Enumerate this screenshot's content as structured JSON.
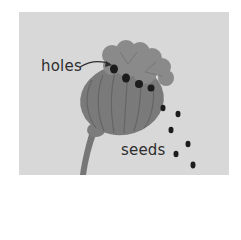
{
  "illustration": {
    "subject": "poppy seed head releasing seeds",
    "background_color": "#d8d8d8",
    "pod_color": "#7a7a7a",
    "crown_color": "#8a8a8a",
    "seed_color": "#1c1c1c",
    "labels": {
      "holes": "holes",
      "seeds": "seeds"
    },
    "seed_count_falling": 6
  }
}
